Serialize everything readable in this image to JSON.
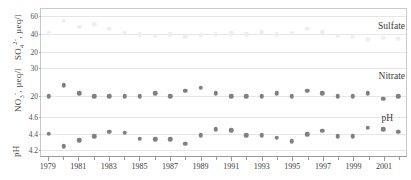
{
  "chart_data": {
    "type": "scatter",
    "title": "",
    "xlabel": "",
    "x_tick_labels": [
      "1979",
      "1981",
      "1983",
      "1985",
      "1987",
      "1989",
      "1991",
      "1993",
      "1995",
      "1997",
      "1999",
      "2001"
    ],
    "x_tick_years": [
      1979,
      1981,
      1983,
      1985,
      1987,
      1989,
      1991,
      1993,
      1995,
      1997,
      1999,
      2001
    ],
    "xlim": [
      1978.5,
      2002.5
    ],
    "grid": true,
    "legend_position": "inside-right",
    "panels": [
      {
        "name": "sulfate",
        "series_label": "Sulfate",
        "ylabel": "SO4 2-, µeq/l",
        "ylabel_base": "SO",
        "ylabel_sub": "4",
        "ylabel_sup": "2-",
        "ylabel_unit": ", µeq/l",
        "ytick_labels": [
          "60",
          "40",
          "20"
        ],
        "ytick_values": [
          60,
          40,
          20
        ],
        "ylim": [
          10,
          68
        ],
        "marker_color": "#eeeeee",
        "x": [
          1979,
          1980,
          1981,
          1982,
          1983,
          1984,
          1985,
          1986,
          1987,
          1988,
          1989,
          1990,
          1991,
          1992,
          1993,
          1994,
          1995,
          1996,
          1997,
          1998,
          1999,
          2000,
          2001,
          2002
        ],
        "values": [
          41,
          55,
          48,
          51,
          46,
          41,
          40,
          38,
          40,
          37,
          39,
          40,
          41,
          40,
          42,
          40,
          41,
          46,
          42,
          38,
          37,
          34,
          36,
          35
        ]
      },
      {
        "name": "nitrate",
        "series_label": "Nitrate",
        "ylabel": "NO3 -, µeq/l",
        "ylabel_base": "NO",
        "ylabel_sub": "3",
        "ylabel_sup": "-",
        "ylabel_unit": ", µeq/l",
        "ytick_labels": [
          "30",
          "20"
        ],
        "ytick_values": [
          30,
          20
        ],
        "ylim": [
          15,
          33
        ],
        "marker_color": "#808080",
        "x": [
          1979,
          1980,
          1981,
          1982,
          1983,
          1984,
          1985,
          1986,
          1987,
          1988,
          1989,
          1990,
          1991,
          1992,
          1993,
          1994,
          1995,
          1996,
          1997,
          1998,
          1999,
          2000,
          2001,
          2002
        ],
        "values": [
          20,
          24,
          21,
          20,
          20,
          20,
          20,
          21,
          20,
          22,
          23,
          21,
          20,
          20,
          20,
          21,
          20,
          22,
          21,
          20,
          20,
          21,
          19,
          20
        ]
      },
      {
        "name": "ph",
        "series_label": "pH",
        "ylabel": "pH",
        "ylabel_base": "pH",
        "ylabel_sub": "",
        "ylabel_sup": "",
        "ylabel_unit": "",
        "ytick_labels": [
          "4.6",
          "4.4",
          "4.2"
        ],
        "ytick_values": [
          4.6,
          4.4,
          4.2
        ],
        "ylim": [
          4.12,
          4.68
        ],
        "marker_color": "#808080",
        "x": [
          1979,
          1980,
          1981,
          1982,
          1983,
          1984,
          1985,
          1986,
          1987,
          1988,
          1989,
          1990,
          1991,
          1992,
          1993,
          1994,
          1995,
          1996,
          1997,
          1998,
          1999,
          2000,
          2001,
          2002
        ],
        "values": [
          4.4,
          4.25,
          4.32,
          4.37,
          4.42,
          4.41,
          4.34,
          4.33,
          4.33,
          4.28,
          4.38,
          4.45,
          4.44,
          4.38,
          4.38,
          4.35,
          4.31,
          4.39,
          4.43,
          4.37,
          4.37,
          4.47,
          4.45,
          4.42
        ]
      }
    ]
  }
}
